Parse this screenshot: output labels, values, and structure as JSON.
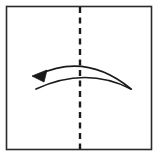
{
  "figure": {
    "background_color": "#ffffff",
    "line_color": "#1a1a1a",
    "paper": {
      "shape": "square",
      "x": 6.5,
      "y": 6.5,
      "width": 145,
      "height": 143,
      "fill": "#ffffff",
      "stroke": "#2a2a2a",
      "stroke_width": 1.6
    },
    "fold_line": {
      "name": "vertical-dashed-fold-line",
      "orientation": "vertical",
      "x": 80,
      "y_start": 7,
      "y_end": 149,
      "stroke": "#1a1a1a",
      "stroke_width": 2.4,
      "dash_length": 6,
      "gap_length": 4.5
    },
    "arrow": {
      "name": "fold-arrow-left",
      "direction": "left",
      "style": "double-arc-lens",
      "stroke": "#1a1a1a",
      "stroke_width": 1.7,
      "upper_arc": {
        "start_x": 38,
        "start_y": 75,
        "control_x": 86,
        "control_y": 52,
        "end_x": 131,
        "end_y": 89
      },
      "lower_arc": {
        "start_x": 36,
        "start_y": 89,
        "control_x": 86,
        "control_y": 66,
        "end_x": 131,
        "end_y": 89
      },
      "head": {
        "name": "arrowhead-triangle",
        "tip_x": 32,
        "tip_y": 76,
        "fill": "#1a1a1a",
        "points": "32,76 47,70 44,82"
      }
    }
  }
}
